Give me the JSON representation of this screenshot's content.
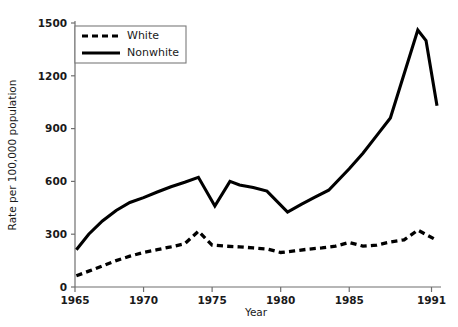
{
  "chart_data": {
    "type": "line",
    "title": "",
    "subtitle": "",
    "xlabel": "Year",
    "ylabel": "Rate per 100,000 population",
    "xlim": [
      1965,
      1991.4
    ],
    "ylim": [
      0,
      1500
    ],
    "yticks": [
      0,
      300,
      600,
      900,
      1200,
      1500
    ],
    "ytick_labels": [
      "0",
      "300",
      "600",
      "900",
      "1200",
      "1500"
    ],
    "xticks": [
      1965,
      1970,
      1975,
      1980,
      1985,
      1991
    ],
    "xtick_labels": [
      "1965",
      "1970",
      "1975",
      "1980",
      "1985",
      "1991"
    ],
    "grid": false,
    "legend_position": "upper left",
    "legend_entries": [
      "White",
      "Nonwhite"
    ],
    "series": [
      {
        "name": "White",
        "style": "dashed",
        "color": "#000000",
        "x": [
          1965.1,
          1966,
          1967,
          1968,
          1969,
          1970,
          1971,
          1972,
          1973,
          1974,
          1975,
          1976,
          1977,
          1978,
          1979,
          1980,
          1981,
          1982,
          1983,
          1984,
          1985,
          1986,
          1987,
          1988,
          1989,
          1990,
          1991.4
        ],
        "values": [
          64,
          90,
          120,
          150,
          175,
          196,
          212,
          228,
          246,
          317,
          238,
          232,
          228,
          222,
          216,
          196,
          205,
          215,
          222,
          232,
          253,
          232,
          238,
          256,
          268,
          323,
          265
        ]
      },
      {
        "name": "Nonwhite",
        "style": "solid",
        "color": "#000000",
        "x": [
          1965.1,
          1966,
          1967,
          1968,
          1969,
          1970,
          1971,
          1972,
          1973,
          1974,
          1975.2,
          1976.3,
          1977,
          1978,
          1979,
          1980.5,
          1981.5,
          1982.5,
          1983.5,
          1985,
          1986,
          1987,
          1988,
          1990,
          1990.6,
          1991.4
        ],
        "values": [
          212,
          300,
          375,
          435,
          480,
          508,
          540,
          570,
          595,
          623,
          460,
          600,
          580,
          565,
          545,
          426,
          470,
          510,
          550,
          672,
          760,
          860,
          960,
          1460,
          1400,
          1030
        ]
      }
    ]
  },
  "legend": {
    "items": [
      {
        "label": "White",
        "style": "dashed"
      },
      {
        "label": "Nonwhite",
        "style": "solid"
      }
    ]
  },
  "axes": {
    "x_title": "Year",
    "y_title": "Rate per 100,000 population"
  }
}
